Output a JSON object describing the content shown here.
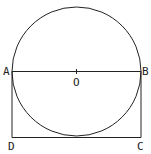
{
  "diagram": {
    "labels": {
      "A": "A",
      "B": "B",
      "C": "C",
      "D": "D",
      "O": "O"
    },
    "stroke_color": "#222222",
    "circle": {
      "cx": 76.5,
      "cy": 71,
      "r": 64.5
    },
    "rect": {
      "x": 12,
      "y": 71,
      "w": 129,
      "h": 66
    }
  }
}
